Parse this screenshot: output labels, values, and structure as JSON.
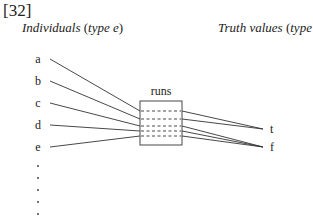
{
  "example_number": "[32]",
  "headers": {
    "left": {
      "text": "Individuals",
      "type_open": " (",
      "type_word": "type",
      "type_var": " e",
      "type_close": ")"
    },
    "right": {
      "text": "Truth values",
      "type_open": " (",
      "type_word": "type",
      "type_var": " t",
      "type_close": ")"
    }
  },
  "box_label": "runs",
  "individuals": [
    "a",
    "b",
    "c",
    "d",
    "e"
  ],
  "truth_values": [
    "t",
    "f"
  ],
  "ellipsis_dots": 5,
  "mapping": {
    "a": "t",
    "b": "t",
    "c": "f",
    "d": "f",
    "e": "f"
  },
  "colors": {
    "ink": "#222222",
    "background": "#ffffff"
  }
}
